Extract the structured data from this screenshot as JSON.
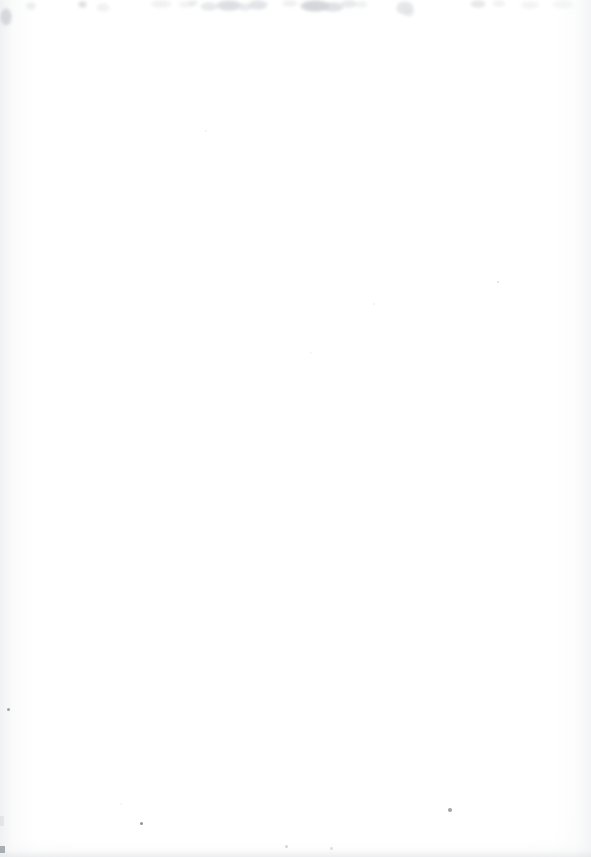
{
  "page": {
    "width": 591,
    "height": 857,
    "background_color": "#ffffff",
    "content_text": ""
  },
  "colors": {
    "paper_white": "#ffffff",
    "paper_offwhite": "#fbfbfc",
    "edge_shadow": "#e4e6e9",
    "debris_gray": "#d8dadd",
    "debris_gray_light": "#e9eaec",
    "speck_dark": "#9aa0a6",
    "corner_dark": "#8a9096"
  },
  "artifacts": {
    "top_debris": [
      {
        "x": 0,
        "y": 8,
        "w": 12,
        "h": 18,
        "color": "#c9ccd0",
        "opacity": 0.72
      },
      {
        "x": 26,
        "y": 2,
        "w": 10,
        "h": 8,
        "color": "#dfe1e4",
        "opacity": 0.6
      },
      {
        "x": 78,
        "y": 1,
        "w": 9,
        "h": 7,
        "color": "#d2d5d9",
        "opacity": 0.7
      },
      {
        "x": 96,
        "y": 3,
        "w": 14,
        "h": 9,
        "color": "#e6e7ea",
        "opacity": 0.55
      },
      {
        "x": 150,
        "y": 0,
        "w": 22,
        "h": 8,
        "color": "#e2e4e7",
        "opacity": 0.5
      },
      {
        "x": 178,
        "y": 1,
        "w": 16,
        "h": 7,
        "color": "#e4e6e9",
        "opacity": 0.48
      },
      {
        "x": 188,
        "y": 0,
        "w": 10,
        "h": 6,
        "color": "#dcdee1",
        "opacity": 0.55
      },
      {
        "x": 200,
        "y": 2,
        "w": 18,
        "h": 9,
        "color": "#d9dbdf",
        "opacity": 0.62
      },
      {
        "x": 216,
        "y": 0,
        "w": 26,
        "h": 11,
        "color": "#ced1d5",
        "opacity": 0.7
      },
      {
        "x": 238,
        "y": 3,
        "w": 14,
        "h": 8,
        "color": "#dadce0",
        "opacity": 0.58
      },
      {
        "x": 248,
        "y": 0,
        "w": 20,
        "h": 10,
        "color": "#d4d7db",
        "opacity": 0.66
      },
      {
        "x": 282,
        "y": 0,
        "w": 16,
        "h": 7,
        "color": "#e0e2e5",
        "opacity": 0.5
      },
      {
        "x": 300,
        "y": 0,
        "w": 30,
        "h": 12,
        "color": "#c6c9ce",
        "opacity": 0.74
      },
      {
        "x": 322,
        "y": 2,
        "w": 22,
        "h": 10,
        "color": "#d0d3d7",
        "opacity": 0.66
      },
      {
        "x": 340,
        "y": 0,
        "w": 18,
        "h": 8,
        "color": "#d9dbdf",
        "opacity": 0.58
      },
      {
        "x": 356,
        "y": 1,
        "w": 12,
        "h": 7,
        "color": "#e1e3e6",
        "opacity": 0.5
      },
      {
        "x": 396,
        "y": 1,
        "w": 18,
        "h": 14,
        "color": "#d5d8dc",
        "opacity": 0.62
      },
      {
        "x": 404,
        "y": 8,
        "w": 10,
        "h": 9,
        "color": "#dfe1e4",
        "opacity": 0.52
      },
      {
        "x": 470,
        "y": 0,
        "w": 16,
        "h": 8,
        "color": "#d7d9dd",
        "opacity": 0.6
      },
      {
        "x": 492,
        "y": 0,
        "w": 14,
        "h": 7,
        "color": "#e3e5e8",
        "opacity": 0.48
      },
      {
        "x": 520,
        "y": 1,
        "w": 20,
        "h": 8,
        "color": "#e5e7ea",
        "opacity": 0.45
      },
      {
        "x": 552,
        "y": 0,
        "w": 22,
        "h": 9,
        "color": "#e7e9eb",
        "opacity": 0.42
      }
    ],
    "specks": [
      {
        "x": 7,
        "y": 708,
        "size": 3,
        "color": "#8a9096",
        "opacity": 0.85
      },
      {
        "x": 140,
        "y": 822,
        "size": 3,
        "color": "#7f858b",
        "opacity": 0.88
      },
      {
        "x": 448,
        "y": 808,
        "size": 4,
        "color": "#868c92",
        "opacity": 0.8
      },
      {
        "x": 497,
        "y": 281,
        "size": 2,
        "color": "#c3c7cb",
        "opacity": 0.55
      },
      {
        "x": 205,
        "y": 130,
        "size": 2,
        "color": "#dcdee1",
        "opacity": 0.45
      },
      {
        "x": 310,
        "y": 352,
        "size": 2,
        "color": "#dfe1e4",
        "opacity": 0.4
      },
      {
        "x": 373,
        "y": 303,
        "size": 2,
        "color": "#dadce0",
        "opacity": 0.45
      },
      {
        "x": 285,
        "y": 845,
        "size": 3,
        "color": "#b9bec3",
        "opacity": 0.6
      },
      {
        "x": 330,
        "y": 847,
        "size": 3,
        "color": "#c2c6cb",
        "opacity": 0.55
      },
      {
        "x": 120,
        "y": 803,
        "size": 2,
        "color": "#e0e2e5",
        "opacity": 0.42
      }
    ],
    "corner_marks": [
      {
        "x": 0,
        "y": 846,
        "w": 5,
        "h": 7,
        "color": "#8f959b",
        "opacity": 0.75
      },
      {
        "x": 0,
        "y": 816,
        "w": 4,
        "h": 10,
        "color": "#d5d8dc",
        "opacity": 0.5
      }
    ]
  }
}
